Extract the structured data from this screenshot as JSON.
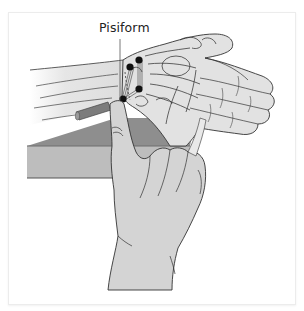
{
  "figure": {
    "labels": {
      "pisiform": "Pisiform"
    },
    "colors": {
      "background": "#ffffff",
      "frame_border": "#ececec",
      "skin_fill": "#d6d6d6",
      "skin_light": "#e4e4e4",
      "outline": "#333333",
      "table_top": "#8c8c8c",
      "table_front": "#b9b9b9",
      "rod": "#7a7a7a",
      "marker_dot": "#111111"
    },
    "markers": [
      {
        "name": "pisiform-proximal-dot"
      },
      {
        "name": "hamate-dot"
      },
      {
        "name": "ligament-dot-lower"
      },
      {
        "name": "pisiform-contact-dot"
      }
    ]
  }
}
